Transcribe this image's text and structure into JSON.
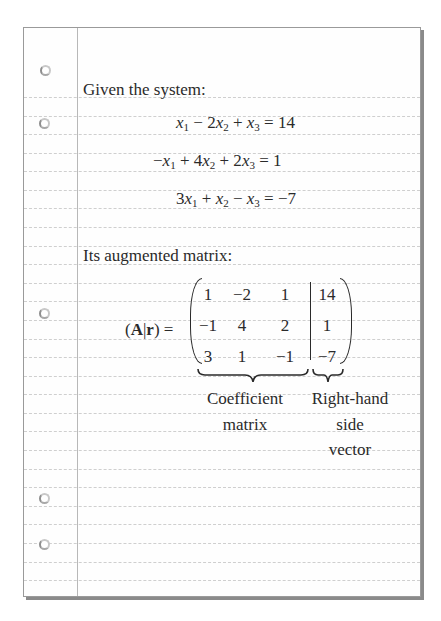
{
  "heading_system": "Given the system:",
  "equations": [
    {
      "lhs": [
        {
          "t": "x",
          "s": "1"
        },
        {
          "op": " − 2"
        },
        {
          "t": "x",
          "s": "2"
        },
        {
          "op": " + "
        },
        {
          "t": "x",
          "s": "3"
        }
      ],
      "text": "x1 − 2x2 + x3",
      "rhs": "14"
    },
    {
      "text": "−x1 + 4x2 + 2x3",
      "rhs": "1"
    },
    {
      "text": "3x1 + x2 − x3",
      "rhs": "−7"
    }
  ],
  "heading_matrix": "Its augmented matrix:",
  "matrix_label": {
    "open": "(",
    "A": "A",
    "bar": "|",
    "r": "r",
    "close": ")",
    "eq": "="
  },
  "coefficient_matrix": [
    [
      "1",
      "−2",
      "1"
    ],
    [
      "−1",
      "4",
      "2"
    ],
    [
      "3",
      "1",
      "−1"
    ]
  ],
  "rhs_vector": [
    "14",
    "1",
    "−7"
  ],
  "annotations": {
    "coefficient": [
      "Coefficient",
      "matrix"
    ],
    "rhs": [
      "Right-hand",
      "side",
      "vector"
    ]
  },
  "paper": {
    "ruled_lines": 27,
    "holes": 5,
    "line_color": "#cfcfcf",
    "margin_color": "#b8b8b8"
  }
}
